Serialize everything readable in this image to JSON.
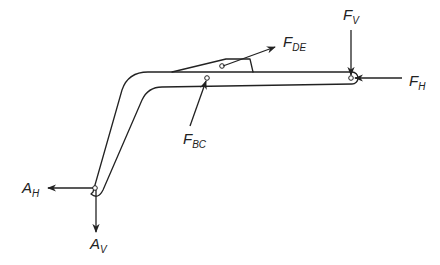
{
  "diagram": {
    "type": "free-body-diagram",
    "colors": {
      "line": "#222222",
      "background": "#ffffff"
    },
    "labels": {
      "F_DE": {
        "main": "F",
        "sub": "DE"
      },
      "F_V": {
        "main": "F",
        "sub": "V"
      },
      "F_H": {
        "main": "F",
        "sub": "H"
      },
      "F_BC": {
        "main": "F",
        "sub": "BC"
      },
      "A_H": {
        "main": "A",
        "sub": "H"
      },
      "A_V": {
        "main": "A",
        "sub": "V"
      }
    },
    "forces": [
      {
        "name": "F_DE",
        "direction": "up-right",
        "point": "D/E pin on tab"
      },
      {
        "name": "F_V",
        "direction": "down",
        "point": "right end pin"
      },
      {
        "name": "F_H",
        "direction": "left",
        "point": "right end pin"
      },
      {
        "name": "F_BC",
        "direction": "up-right (into member)",
        "point": "B/C pin"
      },
      {
        "name": "A_H",
        "direction": "left",
        "point": "pin A"
      },
      {
        "name": "A_V",
        "direction": "down",
        "point": "pin A"
      }
    ]
  }
}
